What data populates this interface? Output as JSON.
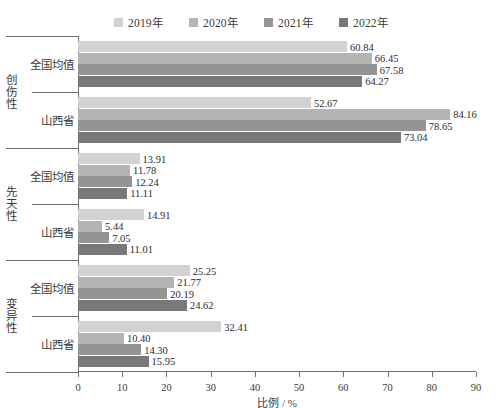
{
  "chart_data": {
    "type": "bar",
    "orientation": "horizontal",
    "title": "",
    "xlabel": "比例 / %",
    "ylabel": "",
    "xlim": [
      0,
      90
    ],
    "xticks": [
      0,
      10,
      20,
      30,
      40,
      50,
      60,
      70,
      80,
      90
    ],
    "grid": false,
    "legend_position": "top-center",
    "legend": [
      "2019年",
      "2020年",
      "2021年",
      "2022年"
    ],
    "series_colors": [
      "#d2d2d2",
      "#b4b4b4",
      "#949494",
      "#787878"
    ],
    "group_labels": [
      "创伤性",
      "先天性",
      "变异性"
    ],
    "categories": [
      "全国均值",
      "山西省"
    ],
    "groups": [
      {
        "group": "创伤性",
        "rows": [
          {
            "category": "全国均值",
            "values": [
              60.84,
              66.45,
              67.58,
              64.27
            ]
          },
          {
            "category": "山西省",
            "values": [
              52.67,
              84.16,
              78.65,
              73.04
            ]
          }
        ]
      },
      {
        "group": "先天性",
        "rows": [
          {
            "category": "全国均值",
            "values": [
              13.91,
              11.78,
              12.24,
              11.11
            ]
          },
          {
            "category": "山西省",
            "values": [
              14.91,
              5.44,
              7.05,
              11.01
            ]
          }
        ]
      },
      {
        "group": "变异性",
        "rows": [
          {
            "category": "全国均值",
            "values": [
              25.25,
              21.77,
              20.19,
              24.62
            ]
          },
          {
            "category": "山西省",
            "values": [
              32.41,
              10.4,
              14.3,
              15.95
            ]
          }
        ]
      }
    ],
    "value_labels": [
      [
        "60.84",
        "66.45",
        "67.58",
        "64.27"
      ],
      [
        "52.67",
        "84.16",
        "78.65",
        "73.04"
      ],
      [
        "13.91",
        "11.78",
        "12.24",
        "11.11"
      ],
      [
        "14.91",
        "5.44",
        "7.05",
        "11.01"
      ],
      [
        "25.25",
        "21.77",
        "20.19",
        "24.62"
      ],
      [
        "32.41",
        "10.40",
        "14.30",
        "15.95"
      ]
    ]
  }
}
